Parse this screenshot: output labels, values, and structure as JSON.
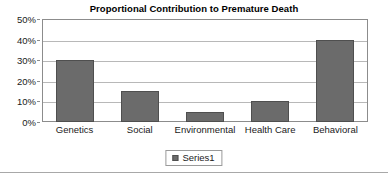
{
  "chart_data": {
    "type": "bar",
    "title": "Proportional Contribution to Premature Death",
    "xlabel": "",
    "ylabel": "",
    "categories": [
      "Genetics",
      "Social",
      "Environmental",
      "Health Care",
      "Behavioral"
    ],
    "values": [
      30,
      15,
      5,
      10,
      40
    ],
    "series": [
      {
        "name": "Series1",
        "values": [
          30,
          15,
          5,
          10,
          40
        ]
      }
    ],
    "ylim": [
      0,
      50
    ],
    "ytick_labels": [
      "0%",
      "10%",
      "20%",
      "30%",
      "40%",
      "50%"
    ],
    "ytick_values": [
      0,
      10,
      20,
      30,
      40,
      50
    ],
    "grid": true,
    "legend_position": "bottom",
    "legend_entries": [
      "Series1"
    ],
    "colors": {
      "bar_fill": "#6b6b6b",
      "bar_border": "#4f4f4f",
      "gridline": "#b8b8b8",
      "frame": "#8c8c8c",
      "background": "#ffffff",
      "text": "#1a1a1a"
    }
  },
  "legend": {
    "swatch_name": "series1-swatch",
    "label": "Series1"
  }
}
